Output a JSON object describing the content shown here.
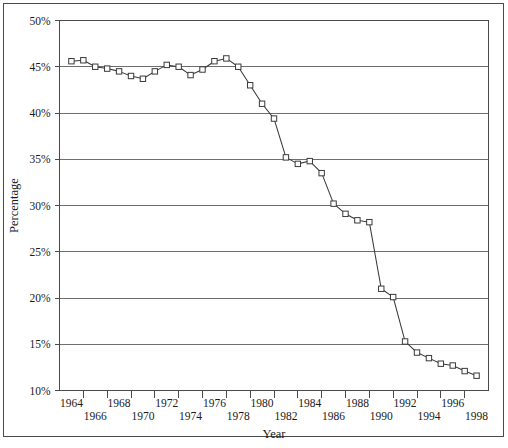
{
  "chart_data": {
    "type": "line",
    "title": "",
    "xlabel": "Year",
    "ylabel": "Percentage",
    "xlim": [
      1963,
      1999
    ],
    "ylim": [
      10,
      50
    ],
    "grid": true,
    "legend": null,
    "y_tick_labels": [
      "50%",
      "45%",
      "40%",
      "35%",
      "30%",
      "25%",
      "20%",
      "15%",
      "10%"
    ],
    "y_tick_values": [
      50,
      45,
      40,
      35,
      30,
      25,
      20,
      15,
      10
    ],
    "x_tick_labels_upper": [
      "1964",
      "1968",
      "1972",
      "1976",
      "1980",
      "1984",
      "1988",
      "1992",
      "1996"
    ],
    "x_tick_labels_lower": [
      "1966",
      "1970",
      "1974",
      "1978",
      "1982",
      "1986",
      "1990",
      "1994",
      "1998"
    ],
    "x_tick_values_upper": [
      1964,
      1968,
      1972,
      1976,
      1980,
      1984,
      1988,
      1992,
      1996
    ],
    "x_tick_values_lower": [
      1966,
      1970,
      1974,
      1978,
      1982,
      1986,
      1990,
      1994,
      1998
    ],
    "marker": "open-square",
    "series": [
      {
        "name": "Percentage",
        "x": [
          1964,
          1965,
          1966,
          1967,
          1968,
          1969,
          1970,
          1971,
          1972,
          1973,
          1974,
          1975,
          1976,
          1977,
          1978,
          1979,
          1980,
          1981,
          1982,
          1983,
          1984,
          1985,
          1986,
          1987,
          1988,
          1989,
          1990,
          1991,
          1992,
          1993,
          1994,
          1995,
          1996,
          1997,
          1998
        ],
        "values": [
          45.6,
          45.7,
          45.0,
          44.8,
          44.5,
          44.0,
          43.7,
          44.5,
          45.2,
          45.0,
          44.1,
          44.7,
          45.6,
          45.9,
          45.0,
          43.0,
          41.0,
          39.4,
          35.2,
          34.5,
          34.8,
          33.5,
          30.2,
          29.1,
          28.4,
          28.2,
          21.0,
          20.1,
          15.3,
          14.1,
          13.5,
          12.9,
          12.7,
          12.1,
          11.6
        ]
      }
    ],
    "colors": {
      "line": "#3a3a3a",
      "marker_fill": "#ffffff",
      "marker_stroke": "#3a3a3a",
      "gridline": "#6e6e6e",
      "frame": "#4a4a4a",
      "background": "#ffffff",
      "text": "#1a1a1a"
    }
  }
}
